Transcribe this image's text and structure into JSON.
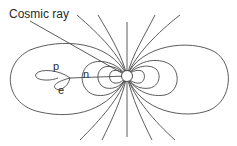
{
  "diagram": {
    "labels": {
      "cosmic_ray": "Cosmic ray",
      "proton": "p",
      "neutron": "n",
      "electron": "e"
    },
    "elements": {
      "nucleus": "central target nucleus (white circle)",
      "field_lines": "dipole-like field lines radiating from nucleus",
      "tracks": [
        "cosmic ray incoming track",
        "proton track loop",
        "electron track loop",
        "neutron track"
      ]
    },
    "colors": {
      "line": "#4a4a4a",
      "text": "#2a2a2a",
      "background": "#ffffff"
    }
  }
}
